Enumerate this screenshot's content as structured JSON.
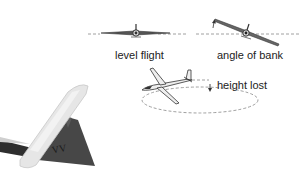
{
  "diagram": {
    "labels": {
      "level_flight": "level flight",
      "angle_of_bank": "angle of bank",
      "height_lost": "height lost"
    },
    "colors": {
      "background": "#ffffff",
      "text": "#222222",
      "glider_outline": "#333333",
      "glider_fill": "#d9d9d9",
      "dashed_line": "#a0a0a0",
      "tail_fin": "#4a4a4a",
      "tailplane": "#e8e8e8"
    },
    "tail_marking": "VV"
  }
}
